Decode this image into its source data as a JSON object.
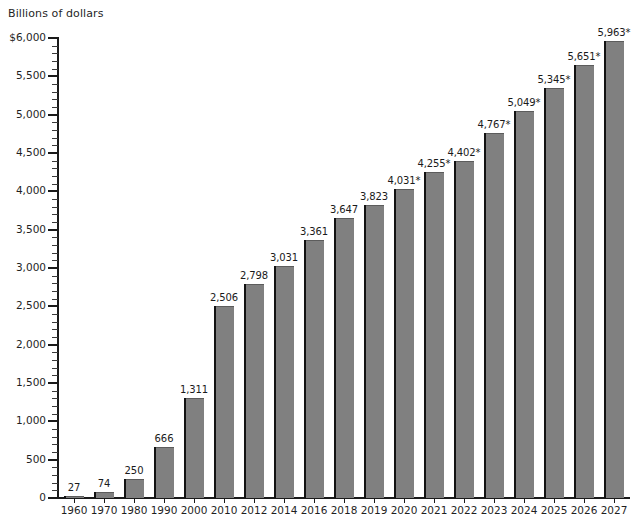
{
  "chart_data": {
    "type": "bar",
    "title": "Billions of dollars",
    "xlabel": "",
    "ylabel": "Billions of dollars",
    "ylim": [
      0,
      6000
    ],
    "ytick_step": 500,
    "yminor_step": 100,
    "grid": false,
    "legend": null,
    "categories": [
      "1960",
      "1970",
      "1980",
      "1990",
      "2000",
      "2010",
      "2012",
      "2014",
      "2016",
      "2018",
      "2019",
      "2020",
      "2021",
      "2022",
      "2023",
      "2024",
      "2025",
      "2026",
      "2027"
    ],
    "values": [
      27,
      74,
      250,
      666,
      1311,
      2506,
      2798,
      3031,
      3361,
      3647,
      3823,
      4031,
      4255,
      4402,
      4767,
      5049,
      5345,
      5651,
      5963
    ],
    "value_labels": [
      "27",
      "74",
      "250",
      "666",
      "1,311",
      "2,506",
      "2,798",
      "3,031",
      "3,361",
      "3,647",
      "3,823",
      "4,031*",
      "4,255*",
      "4,402*",
      "4,767*",
      "5,049*",
      "5,345*",
      "5,651*",
      "5,963*"
    ],
    "projected_flags": [
      false,
      false,
      false,
      false,
      false,
      false,
      false,
      false,
      false,
      false,
      false,
      true,
      true,
      true,
      true,
      true,
      true,
      true,
      true
    ],
    "ytick_labels": [
      "$6,000",
      "5,500",
      "5,000",
      "4,500",
      "4,000",
      "3,500",
      "3,000",
      "2,500",
      "2,000",
      "1,500",
      "1,000",
      "500",
      "0"
    ],
    "ytick_values": [
      6000,
      5500,
      5000,
      4500,
      4000,
      3500,
      3000,
      2500,
      2000,
      1500,
      1000,
      500,
      0
    ],
    "colors": {
      "bar_face": "#808080",
      "bar_edge": "#121212",
      "axis": "#1a1a1a",
      "background": "#ffffff",
      "text": "#1f1f1f"
    }
  }
}
